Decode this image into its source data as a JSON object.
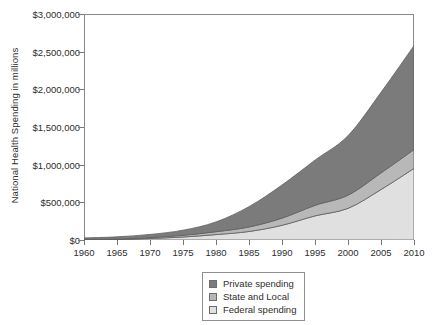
{
  "chart_data": {
    "type": "area",
    "stacked": true,
    "title": "",
    "xlabel": "",
    "ylabel": "National Health Spending in millions",
    "xlim": [
      1960,
      2010
    ],
    "ylim": [
      0,
      3000000
    ],
    "grid": false,
    "legend_position": "bottom-center",
    "x": [
      1960,
      1965,
      1970,
      1975,
      1980,
      1985,
      1990,
      1995,
      2000,
      2005,
      2010
    ],
    "xticklabels": [
      "1960",
      "1965",
      "1970",
      "1975",
      "1980",
      "1985",
      "1990",
      "1995",
      "2000",
      "2005",
      "2010"
    ],
    "yticks": [
      0,
      500000,
      1000000,
      1500000,
      2000000,
      2500000,
      3000000
    ],
    "yticklabels": [
      "$0",
      "$500,000",
      "$1,000,000",
      "$1,500,000",
      "$2,000,000",
      "$2,500,000",
      "$3,000,000"
    ],
    "series": [
      {
        "name": "Federal spending",
        "color": "#e0e0e0",
        "values": [
          3000,
          6000,
          20000,
          40000,
          72000,
          113000,
          195000,
          320000,
          420000,
          670000,
          950000
        ]
      },
      {
        "name": "State and Local",
        "color": "#b8b8b8",
        "values": [
          3000,
          6000,
          12000,
          22000,
          38000,
          60000,
          95000,
          140000,
          175000,
          220000,
          250000
        ]
      },
      {
        "name": "Private spending",
        "color": "#7b7b7b",
        "values": [
          21000,
          30000,
          42000,
          68000,
          130000,
          270000,
          440000,
          600000,
          790000,
          1070000,
          1380000
        ]
      }
    ],
    "totals": [
      27000,
      42000,
      74000,
      130000,
      240000,
      443000,
      730000,
      1060000,
      1385000,
      1960000,
      2580000
    ]
  },
  "legend": {
    "items": [
      {
        "label": "Private spending",
        "color": "#7b7b7b"
      },
      {
        "label": "State and Local",
        "color": "#b8b8b8"
      },
      {
        "label": "Federal spending",
        "color": "#e0e0e0"
      }
    ]
  }
}
